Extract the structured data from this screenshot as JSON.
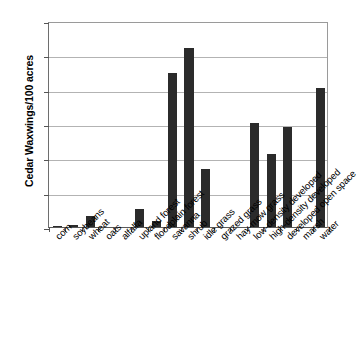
{
  "chart_data": {
    "type": "bar",
    "title": "",
    "subtitle": "",
    "xlabel": "",
    "ylabel": "Cedar Waxwings/100 acres",
    "ylim": [
      0,
      30
    ],
    "ytick_labels": [
      "0",
      "5",
      "10",
      "15",
      "20",
      "25",
      "30"
    ],
    "ytick_values": [
      0,
      5,
      10,
      15,
      20,
      25,
      30
    ],
    "grid": "horizontal",
    "legend": "none",
    "bar_color": "#2b2b2b",
    "categories": [
      "corn",
      "soybeans",
      "wheat",
      "oats",
      "alfalfa",
      "upland forest",
      "floodplain forest",
      "savanna",
      "shrub",
      "idle grass",
      "grazed grass",
      "hay-mow grass",
      "low-density developed",
      "high-density developed",
      "developed open space",
      "marsh",
      "water"
    ],
    "values": [
      0.2,
      0.25,
      1.6,
      0,
      0,
      2.6,
      0.9,
      22.5,
      26.0,
      8.4,
      0,
      0,
      15.2,
      10.7,
      14.6,
      0,
      20.3
    ]
  }
}
